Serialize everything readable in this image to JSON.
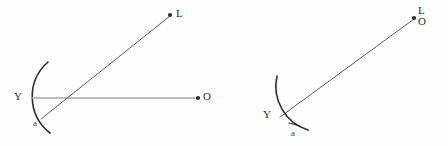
{
  "figure": {
    "background_color": "#fefefe",
    "stroke_dark": "#2b2b2b",
    "stroke_mid": "#4a4a4a",
    "stroke_light": "#a8a8a8",
    "label_color": "#2b2b2b"
  },
  "left_figure": {
    "name": "left-diagram",
    "mirror_label": "Y",
    "angle_label": "a",
    "ray_end_label": "L",
    "axis_end_label": "O",
    "arc": {
      "start_x": 48,
      "start_y": 62,
      "end_x": 50,
      "end_y": 133,
      "radius": 46,
      "sweep": 0,
      "color": "#2b2b2b",
      "width": 1.6
    },
    "axis_ray": {
      "x1": 32,
      "y1": 98,
      "x2": 197,
      "y2": 98,
      "color": "#a8a8a8",
      "width": 1.5,
      "dot_x": 198,
      "dot_y": 98,
      "dot_r": 2.1
    },
    "diagonal_ray": {
      "x1": 41,
      "y1": 119,
      "x2": 170,
      "y2": 16,
      "color": "#4a4a4a",
      "width": 0.9,
      "dot_x": 170,
      "dot_y": 15,
      "dot_r": 2.1
    },
    "labels": {
      "Y": {
        "x": 14,
        "y": 92
      },
      "a": {
        "x": 33,
        "y": 120
      },
      "L": {
        "x": 176,
        "y": 9
      },
      "O": {
        "x": 203,
        "y": 92
      }
    }
  },
  "right_figure": {
    "name": "right-diagram",
    "mirror_label": "Y",
    "angle_label": "a",
    "ray_end_label_top": "L",
    "ray_end_label_bottom": "O",
    "arc": {
      "start_x": 277,
      "start_y": 76,
      "end_x": 308,
      "end_y": 130,
      "radius": 46,
      "sweep": 0,
      "color": "#2b2b2b",
      "width": 1.6
    },
    "diagonal_ray": {
      "x1": 280,
      "y1": 117,
      "x2": 414,
      "y2": 19,
      "color": "#4a4a4a",
      "width": 0.9,
      "dot_x": 414,
      "dot_y": 18,
      "dot_r": 2.1
    },
    "angle_tick": {
      "x1": 290,
      "y1": 124,
      "x2": 300,
      "y2": 126,
      "color": "#2b2b2b",
      "width": 1.1
    },
    "labels": {
      "Y": {
        "x": 263,
        "y": 110
      },
      "a": {
        "x": 291,
        "y": 130
      },
      "L": {
        "x": 418,
        "y": 7
      },
      "O": {
        "x": 418,
        "y": 17
      }
    }
  }
}
